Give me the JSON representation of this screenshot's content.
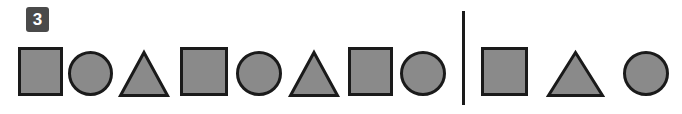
{
  "question": {
    "number_badge": "3",
    "badge_color": "#4a4a4a",
    "badge_text_color": "#ffffff"
  },
  "style": {
    "shape_fill": "#8a8a8a",
    "shape_stroke": "#1a1a1a",
    "background": "#ffffff",
    "divider_color": "#1a1a1a"
  },
  "sequence": {
    "label": "pattern-sequence",
    "items": [
      {
        "shape": "square",
        "x": 18,
        "y": 47,
        "w": 45,
        "h": 49
      },
      {
        "shape": "circle",
        "x": 68,
        "y": 51,
        "w": 45,
        "h": 45
      },
      {
        "shape": "triangle",
        "x": 119,
        "y": 51,
        "w": 50,
        "h": 46
      },
      {
        "shape": "square",
        "x": 180,
        "y": 47,
        "w": 48,
        "h": 49
      },
      {
        "shape": "circle",
        "x": 236,
        "y": 51,
        "w": 46,
        "h": 45
      },
      {
        "shape": "triangle",
        "x": 289,
        "y": 51,
        "w": 50,
        "h": 46
      },
      {
        "shape": "square",
        "x": 348,
        "y": 47,
        "w": 45,
        "h": 49
      },
      {
        "shape": "circle",
        "x": 400,
        "y": 51,
        "w": 46,
        "h": 45
      }
    ]
  },
  "options": {
    "label": "answer-options",
    "items": [
      {
        "shape": "square",
        "x": 481,
        "y": 47,
        "w": 47,
        "h": 49
      },
      {
        "shape": "triangle",
        "x": 547,
        "y": 51,
        "w": 57,
        "h": 46
      },
      {
        "shape": "circle",
        "x": 623,
        "y": 51,
        "w": 46,
        "h": 45
      }
    ]
  }
}
